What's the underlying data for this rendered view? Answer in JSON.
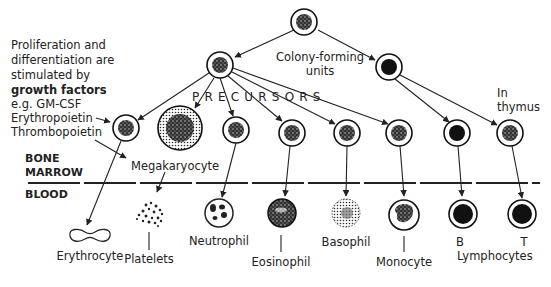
{
  "diagram": {
    "intro": {
      "line1": "Proliferation and",
      "line2": "differentiation are",
      "line3": "stimulated by",
      "line4_bold": "growth factors",
      "line5": "e.g. GM-CSF",
      "line6": "Erythropoietin",
      "line7": "Thrombopoietin"
    },
    "stem_label_1": "Colony-forming",
    "stem_label_2": "units",
    "precursors_label": "PRECURSORS",
    "thymus_label_1": "In",
    "thymus_label_2": "thymus",
    "regions": {
      "bone": "BONE",
      "marrow": "MARROW",
      "blood": "BLOOD"
    },
    "megakaryocyte_label": "Megakaryocyte",
    "blood_cells": {
      "erythrocyte": "Erythrocyte",
      "platelets": "Platelets",
      "neutrophil": "Neutrophil",
      "eosinophil": "Eosinophil",
      "basophil": "Basophil",
      "monocyte": "Monocyte",
      "b": "B",
      "t": "T",
      "lymphocytes": "Lymphocytes"
    },
    "colors": {
      "ink": "#222222",
      "background": "#ffffff"
    }
  }
}
